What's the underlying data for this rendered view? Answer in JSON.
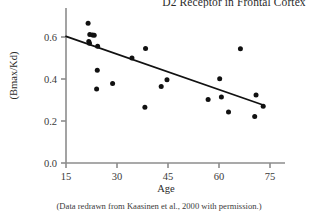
{
  "chart_data": {
    "type": "scatter",
    "title": "D2 Receptor in Frontal Cortex",
    "xlabel": "Age",
    "ylabel": "(Bmax/Kd)",
    "caption": "(Data redrawn from Kaasinen et al., 2000 with permission.)",
    "xlim": [
      15,
      77
    ],
    "ylim": [
      0.0,
      0.68
    ],
    "xticks": [
      15,
      30,
      45,
      60,
      75
    ],
    "xtick_labels": [
      "15",
      "30",
      "45",
      "60",
      "75"
    ],
    "yticks": [
      0.0,
      0.2,
      0.4,
      0.6
    ],
    "ytick_labels": [
      "0.0",
      "0.2",
      "0.4",
      "0.6"
    ],
    "grid": false,
    "legend": false,
    "marker_color": "#111111",
    "line_color": "#111111",
    "axis_color": "#8c8c8c",
    "points": [
      {
        "x": 21.5,
        "y": 0.665
      },
      {
        "x": 22.0,
        "y": 0.612
      },
      {
        "x": 22.8,
        "y": 0.61
      },
      {
        "x": 23.3,
        "y": 0.608
      },
      {
        "x": 21.7,
        "y": 0.578
      },
      {
        "x": 21.9,
        "y": 0.57
      },
      {
        "x": 24.3,
        "y": 0.556
      },
      {
        "x": 24.2,
        "y": 0.442
      },
      {
        "x": 24.0,
        "y": 0.352
      },
      {
        "x": 28.7,
        "y": 0.378
      },
      {
        "x": 34.4,
        "y": 0.5
      },
      {
        "x": 38.4,
        "y": 0.545
      },
      {
        "x": 38.2,
        "y": 0.265
      },
      {
        "x": 43.0,
        "y": 0.364
      },
      {
        "x": 44.7,
        "y": 0.397
      },
      {
        "x": 56.8,
        "y": 0.302
      },
      {
        "x": 60.2,
        "y": 0.401
      },
      {
        "x": 60.7,
        "y": 0.314
      },
      {
        "x": 62.8,
        "y": 0.243
      },
      {
        "x": 66.3,
        "y": 0.544
      },
      {
        "x": 70.9,
        "y": 0.324
      },
      {
        "x": 70.5,
        "y": 0.221
      },
      {
        "x": 73.0,
        "y": 0.27
      }
    ],
    "trendline": {
      "x_start": 15.0,
      "y_start": 0.603,
      "x_end": 73.0,
      "y_end": 0.276
    }
  }
}
